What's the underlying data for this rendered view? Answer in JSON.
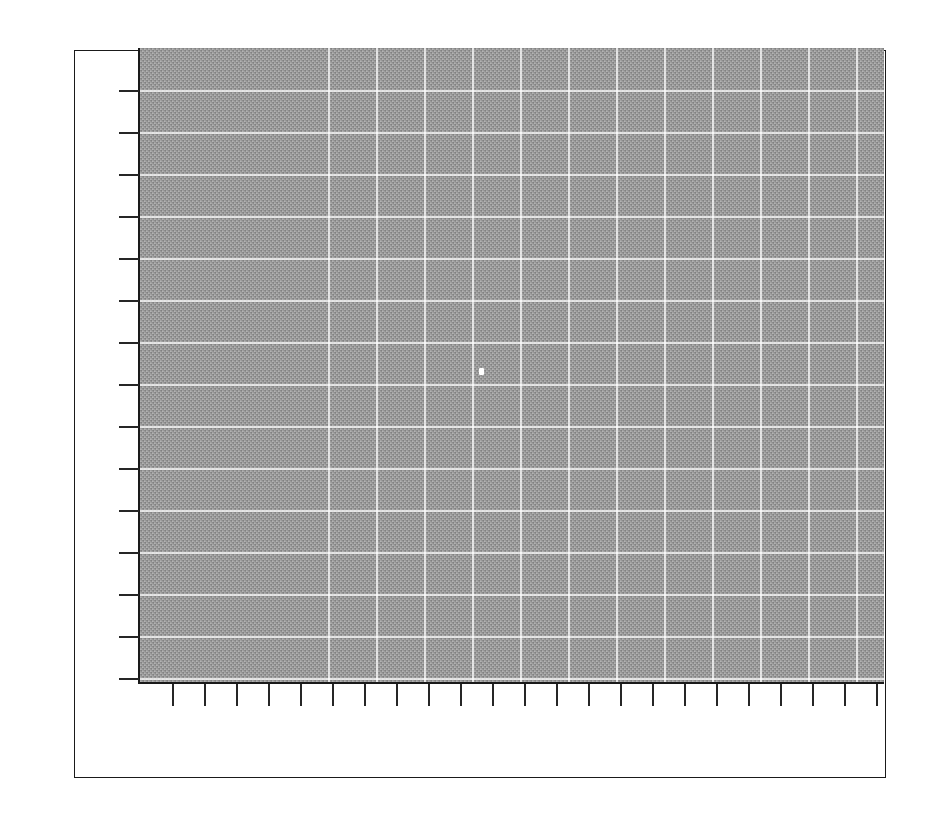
{
  "figure": {
    "title": "",
    "background_color": "#ffffff",
    "frame_color": "#1a1a1a",
    "frame_rect": {
      "x": 74,
      "y": 50,
      "width": 812,
      "height": 728
    }
  },
  "axes": {
    "rect": {
      "x": 140,
      "y": 48,
      "width": 744,
      "height": 634
    },
    "facecolor": "#a8a8a8",
    "dither_dark": "#8d8d8d",
    "grid_color": "#ffffff",
    "spine_color": "#1a1a1a",
    "tick_color": "#262626",
    "xlabel": "",
    "ylabel": "",
    "xticklabels": [],
    "yticklabels": []
  },
  "chart_data": {
    "type": "scatter",
    "title": "",
    "subtitle": "",
    "xlabel": "",
    "ylabel": "",
    "legend": [],
    "legend_position": "none",
    "grid": true,
    "grid_color": "#ffffff",
    "facecolor": "#a8a8a8",
    "xlim": [
      0,
      23
    ],
    "ylim": [
      0,
      15
    ],
    "x_major_gridlines": [
      1,
      2,
      3,
      4,
      5,
      6,
      7,
      8,
      9,
      10,
      11,
      12,
      13,
      14,
      15,
      16,
      17,
      18,
      19,
      20,
      21,
      22
    ],
    "y_major_gridlines": [
      1,
      2,
      3,
      4,
      5,
      6,
      7,
      8,
      9,
      10,
      11,
      12,
      13,
      14
    ],
    "xticks": [
      0.5,
      1.5,
      2.5,
      3.5,
      4.5,
      5.5,
      6.5,
      7.5,
      8.5,
      9.5,
      10.5,
      11.5,
      12.5,
      13.5,
      14.5,
      15.5,
      16.5,
      17.5,
      18.5,
      19.5,
      20.5,
      21.5,
      22.5
    ],
    "yticks": [
      0.5,
      1.5,
      2.5,
      3.5,
      4.5,
      5.5,
      6.5,
      7.5,
      8.5,
      9.5,
      10.5,
      11.5,
      12.5,
      13.5,
      14.5
    ],
    "xticklabels": [],
    "yticklabels": [],
    "series": [
      {
        "name": "",
        "marker": "point",
        "color": "#ffffff",
        "x": [
          10.5
        ],
        "y": [
          7.7
        ]
      }
    ]
  },
  "grid_geometry": {
    "vertical_gridlines_px": [
      188,
      236,
      284,
      332,
      380,
      428,
      476,
      524,
      572,
      620,
      668,
      716,
      764,
      812,
      860
    ],
    "horizontal_gridlines_px": [
      42,
      84,
      126,
      168,
      210,
      252,
      294,
      336,
      378,
      420,
      462,
      504,
      546,
      588,
      630
    ],
    "y_ticks_px": [
      42,
      84,
      126,
      168,
      210,
      252,
      294,
      336,
      378,
      420,
      462,
      504,
      546,
      588,
      630
    ],
    "x_ticks_px": [
      32,
      64,
      96,
      128,
      160,
      192,
      224,
      256,
      288,
      320,
      352,
      384,
      416,
      448,
      480,
      512,
      544,
      576,
      608,
      640,
      672,
      704,
      736
    ],
    "marker_px": {
      "x": 339,
      "y": 320
    }
  }
}
